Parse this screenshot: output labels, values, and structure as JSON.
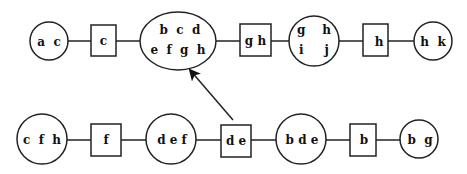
{
  "diagram": {
    "type": "junction-tree-transformation",
    "top_row": {
      "nodes": [
        {
          "id": "t1",
          "shape": "circle",
          "label_lines": [
            "a  c"
          ]
        },
        {
          "id": "t2",
          "shape": "box",
          "label_lines": [
            "c"
          ]
        },
        {
          "id": "t3",
          "shape": "ellipse",
          "label_lines": [
            "b  c  d",
            "e  f  g  h"
          ]
        },
        {
          "id": "t4",
          "shape": "box",
          "label_lines": [
            "g h"
          ]
        },
        {
          "id": "t5",
          "shape": "circle",
          "label_lines": [
            "g    h",
            "i     j"
          ]
        },
        {
          "id": "t6",
          "shape": "box",
          "label_lines": [
            "h"
          ]
        },
        {
          "id": "t7",
          "shape": "circle",
          "label_lines": [
            "h  k"
          ]
        }
      ]
    },
    "bottom_row": {
      "nodes": [
        {
          "id": "b1",
          "shape": "circle",
          "label_lines": [
            "c  f  h"
          ]
        },
        {
          "id": "b2",
          "shape": "box",
          "label_lines": [
            "f"
          ]
        },
        {
          "id": "b3",
          "shape": "circle",
          "label_lines": [
            "d e f"
          ]
        },
        {
          "id": "b4",
          "shape": "box",
          "label_lines": [
            "d e"
          ]
        },
        {
          "id": "b5",
          "shape": "circle",
          "label_lines": [
            "b d e"
          ]
        },
        {
          "id": "b6",
          "shape": "box",
          "label_lines": [
            "b"
          ]
        },
        {
          "id": "b7",
          "shape": "circle",
          "label_lines": [
            "b  g"
          ]
        }
      ]
    },
    "arrow": {
      "from": "b4",
      "to": "t3"
    },
    "colors": {
      "stroke": "#222222",
      "text": "#111111",
      "background": "#ffffff"
    }
  }
}
